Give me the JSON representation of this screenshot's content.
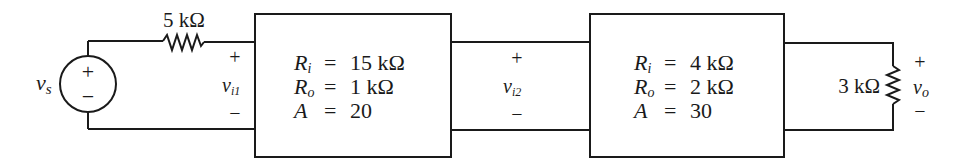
{
  "source": {
    "label": "v",
    "label_sub": "s",
    "plus": "+",
    "minus": "−"
  },
  "series_resistor": {
    "value": "5 kΩ"
  },
  "stage1_input": {
    "plus": "+",
    "label": "v",
    "label_sub": "i1",
    "minus": "−"
  },
  "amplifier1": {
    "lines": [
      {
        "sym": "R",
        "sub": "i",
        "eq": "=",
        "value": "15 kΩ"
      },
      {
        "sym": "R",
        "sub": "o",
        "eq": "=",
        "value": "1 kΩ"
      },
      {
        "sym": "A",
        "sub": "",
        "eq": "=",
        "value": "20"
      }
    ]
  },
  "stage2_input": {
    "plus": "+",
    "label": "v",
    "label_sub": "i2",
    "minus": "−"
  },
  "amplifier2": {
    "lines": [
      {
        "sym": "R",
        "sub": "i",
        "eq": "=",
        "value": "4 kΩ"
      },
      {
        "sym": "R",
        "sub": "o",
        "eq": "=",
        "value": "2 kΩ"
      },
      {
        "sym": "A",
        "sub": "",
        "eq": "=",
        "value": "30"
      }
    ]
  },
  "load_resistor": {
    "value": "3 kΩ"
  },
  "output": {
    "plus": "+",
    "label": "v",
    "label_sub": "o",
    "minus": "−"
  }
}
